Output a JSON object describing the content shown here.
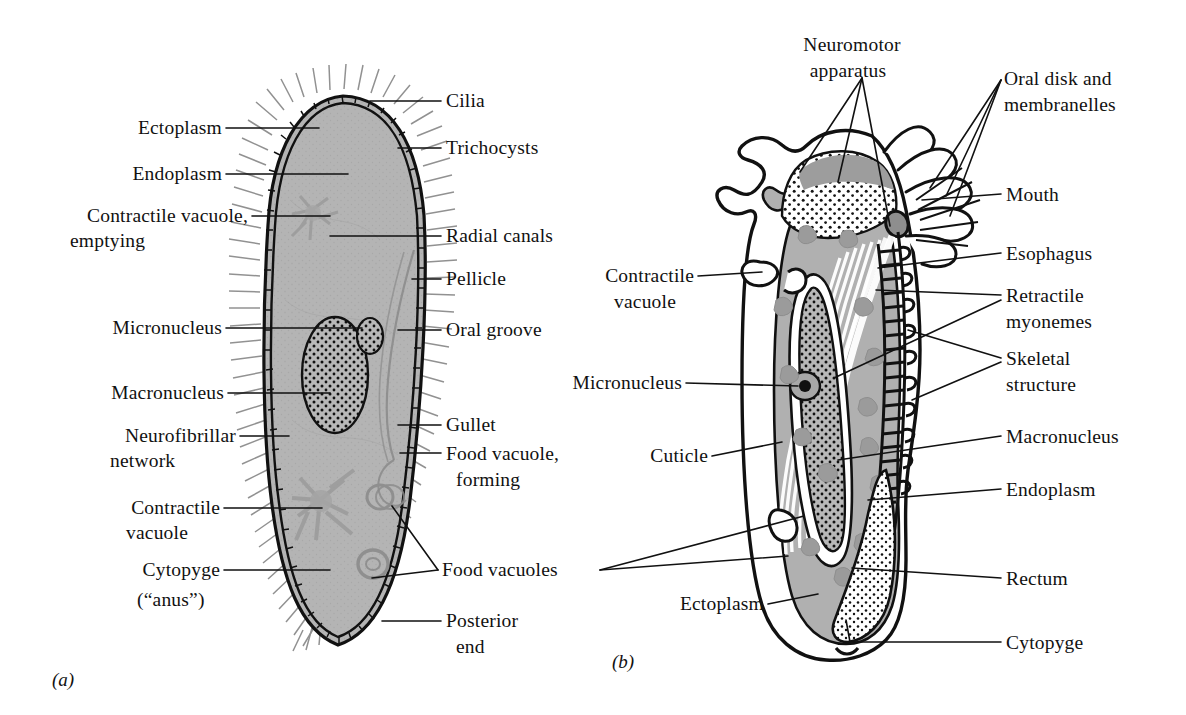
{
  "figure": {
    "panels": [
      {
        "id": "a",
        "tag": "(a)",
        "organism": "Paramecium",
        "labels_left": [
          {
            "name": "ectoplasm",
            "text": "Ectoplasm",
            "lines": [
              "Ectoplasm"
            ]
          },
          {
            "name": "endoplasm",
            "text": "Endoplasm",
            "lines": [
              "Endoplasm"
            ]
          },
          {
            "name": "contractile-vacuole-emptying",
            "text": "Contractile vacuole, emptying",
            "lines": [
              "Contractile vacuole,",
              "emptying"
            ]
          },
          {
            "name": "micronucleus",
            "text": "Micronucleus",
            "lines": [
              "Micronucleus"
            ]
          },
          {
            "name": "macronucleus",
            "text": "Macronucleus",
            "lines": [
              "Macronucleus"
            ]
          },
          {
            "name": "neurofibrillar-network",
            "text": "Neurofibrillar network",
            "lines": [
              "Neurofibrillar",
              "network"
            ]
          },
          {
            "name": "contractile-vacuole",
            "text": "Contractile vacuole",
            "lines": [
              "Contractile",
              "vacuole"
            ]
          },
          {
            "name": "cytopyge",
            "text": "Cytopyge (\"anus\")",
            "lines": [
              "Cytopyge",
              "(“anus”)"
            ]
          }
        ],
        "labels_right": [
          {
            "name": "cilia",
            "text": "Cilia",
            "lines": [
              "Cilia"
            ]
          },
          {
            "name": "trichocysts",
            "text": "Trichocysts",
            "lines": [
              "Trichocysts"
            ]
          },
          {
            "name": "radial-canals",
            "text": "Radial canals",
            "lines": [
              "Radial canals"
            ]
          },
          {
            "name": "pellicle",
            "text": "Pellicle",
            "lines": [
              "Pellicle"
            ]
          },
          {
            "name": "oral-groove",
            "text": "Oral groove",
            "lines": [
              "Oral groove"
            ]
          },
          {
            "name": "gullet",
            "text": "Gullet",
            "lines": [
              "Gullet"
            ]
          },
          {
            "name": "food-vacuole-forming",
            "text": "Food vacuole, forming",
            "lines": [
              "Food vacuole,",
              "forming"
            ]
          },
          {
            "name": "food-vacuoles",
            "text": "Food vacuoles",
            "lines": [
              "Food vacuoles"
            ]
          },
          {
            "name": "posterior-end",
            "text": "Posterior end",
            "lines": [
              "Posterior",
              "end"
            ]
          }
        ]
      },
      {
        "id": "b",
        "tag": "(b)",
        "organism": "Stentor",
        "labels_top": [
          {
            "name": "neuromotor-apparatus",
            "text": "Neuromotor apparatus",
            "lines": [
              "Neuromotor",
              "apparatus"
            ]
          },
          {
            "name": "oral-disk-and-membranelles",
            "text": "Oral disk and membranelles",
            "lines": [
              "Oral disk and",
              "membranelles"
            ]
          }
        ],
        "labels_left": [
          {
            "name": "contractile-vacuole",
            "text": "Contractile vacuole",
            "lines": [
              "Contractile",
              "vacuole"
            ]
          },
          {
            "name": "micronucleus",
            "text": "Micronucleus",
            "lines": [
              "Micronucleus"
            ]
          },
          {
            "name": "cuticle",
            "text": "Cuticle",
            "lines": [
              "Cuticle"
            ]
          },
          {
            "name": "ectoplasm",
            "text": "Ectoplasm",
            "lines": [
              "Ectoplasm"
            ]
          }
        ],
        "labels_right": [
          {
            "name": "mouth",
            "text": "Mouth",
            "lines": [
              "Mouth"
            ]
          },
          {
            "name": "esophagus",
            "text": "Esophagus",
            "lines": [
              "Esophagus"
            ]
          },
          {
            "name": "retractile-myonemes",
            "text": "Retractile myonemes",
            "lines": [
              "Retractile",
              "myonemes"
            ]
          },
          {
            "name": "skeletal-structure",
            "text": "Skeletal structure",
            "lines": [
              "Skeletal",
              "structure"
            ]
          },
          {
            "name": "macronucleus",
            "text": "Macronucleus",
            "lines": [
              "Macronucleus"
            ]
          },
          {
            "name": "endoplasm",
            "text": "Endoplasm",
            "lines": [
              "Endoplasm"
            ]
          },
          {
            "name": "rectum",
            "text": "Rectum",
            "lines": [
              "Rectum"
            ]
          },
          {
            "name": "cytopyge",
            "text": "Cytopyge",
            "lines": [
              "Cytopyge"
            ]
          }
        ]
      }
    ],
    "colors": {
      "background": "#ffffff",
      "ink": "#111111",
      "cytoplasm_gray": "#b4b4b4",
      "cytoplasm_gray_dark": "#9e9e9e",
      "organelle_gray": "#9a9a9a",
      "cilia_gray": "#8f8f8f",
      "white": "#ffffff"
    }
  }
}
